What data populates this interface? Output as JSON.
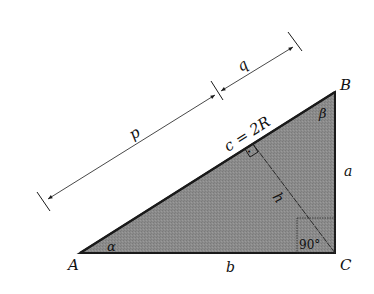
{
  "diagram": {
    "type": "right-triangle",
    "fill_color": "#8b8b8b",
    "stroke_color": "#1a1a1a",
    "vertices": {
      "A": {
        "label": "A",
        "x": 80,
        "y": 253
      },
      "B": {
        "label": "B",
        "x": 335,
        "y": 92
      },
      "C": {
        "label": "C",
        "x": 335,
        "y": 253
      }
    },
    "sides": {
      "a": "a",
      "b": "b",
      "c": "c = 2R"
    },
    "angles": {
      "alpha": "α",
      "beta": "β",
      "right_angle": "90°"
    },
    "altitude": {
      "label": "h",
      "foot_mark": "•"
    },
    "segments": {
      "p": "p",
      "q": "q"
    }
  }
}
